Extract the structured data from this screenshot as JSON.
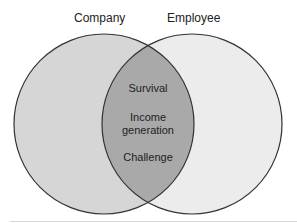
{
  "diagram": {
    "type": "venn",
    "sets": [
      {
        "label": "Company",
        "fill": "#d6d6d6"
      },
      {
        "label": "Employee",
        "fill": "#ececec"
      }
    ],
    "overlap": {
      "fill": "#a9a9a9",
      "items": [
        "Survival",
        "Income generation",
        "Challenge"
      ],
      "lines": [
        "Survival",
        "Income",
        "generation",
        "Challenge"
      ]
    },
    "stroke": "#333333"
  }
}
